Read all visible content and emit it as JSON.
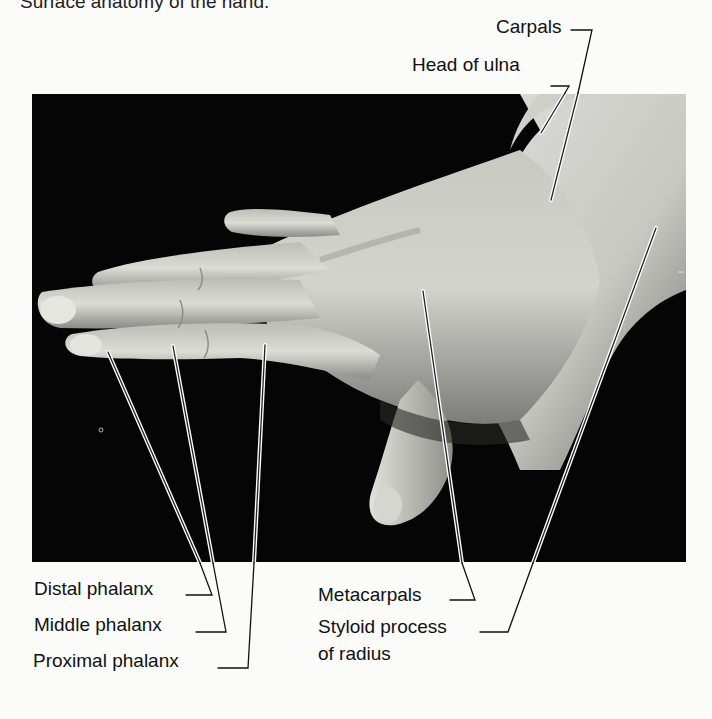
{
  "caption": {
    "text": "Surface anatomy of the hand."
  },
  "figure": {
    "background_color": "#050505",
    "skin_light": "#d9d9d4",
    "skin_mid": "#a8a8a3",
    "leader_line_color": "#111111"
  },
  "labels": {
    "carpals": "Carpals",
    "head_of_ulna": "Head of ulna",
    "distal_phalanx": "Distal phalanx",
    "middle_phalanx": "Middle phalanx",
    "proximal_phalanx": "Proximal phalanx",
    "metacarpals": "Metacarpals",
    "styloid_line1": "Styloid process",
    "styloid_line2": "of radius"
  }
}
